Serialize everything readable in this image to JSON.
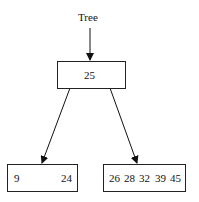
{
  "diagram": {
    "root_label": "Tree",
    "root_node": {
      "keys": [
        "25"
      ]
    },
    "children": [
      {
        "keys": [
          "9",
          "24"
        ]
      },
      {
        "keys": [
          "26",
          "28",
          "32",
          "39",
          "45"
        ]
      }
    ]
  }
}
